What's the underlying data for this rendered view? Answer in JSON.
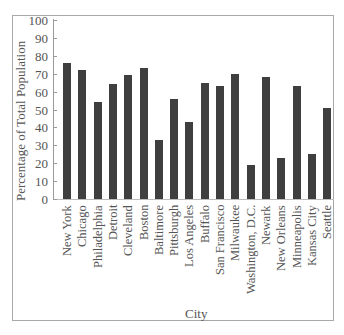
{
  "chart_data": {
    "type": "bar",
    "title": "",
    "xlabel": "City",
    "ylabel": "Percentage of Total Population",
    "ylim": [
      0,
      100
    ],
    "yticks": [
      0,
      10,
      20,
      30,
      40,
      50,
      60,
      70,
      80,
      90,
      100
    ],
    "grid": false,
    "legend": null,
    "categories": [
      "New York",
      "Chicago",
      "Philadelphia",
      "Detroit",
      "Cleveland",
      "Boston",
      "Baltimore",
      "Pittsburgh",
      "Los Angeles",
      "Buffalo",
      "San Francisco",
      "Milwaukee",
      "Washington, D.C.",
      "Newark",
      "New Orleans",
      "Minneapolis",
      "Kansas City",
      "Seattle"
    ],
    "values": [
      76,
      72,
      54,
      64,
      69,
      73,
      33,
      56,
      43,
      65,
      63,
      70,
      19,
      68,
      23,
      63,
      25,
      51
    ],
    "bar_color": "#3f3f3f"
  }
}
